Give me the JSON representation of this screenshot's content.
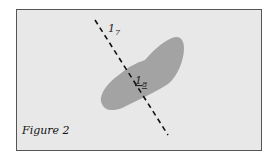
{
  "figure": {
    "caption": "Figure 2",
    "labels": {
      "upper": {
        "main": "1",
        "sub": "7"
      },
      "center": {
        "main": "1",
        "sub": "8"
      }
    },
    "colors": {
      "background": "#e8e8e8",
      "blob": "#a3a3a3",
      "border": "#555555",
      "line": "#111111"
    }
  }
}
